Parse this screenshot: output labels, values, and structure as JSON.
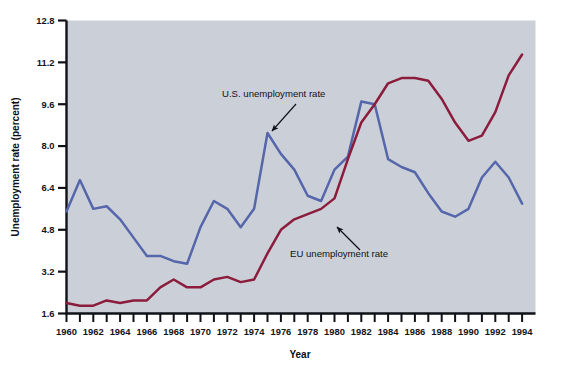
{
  "figure": {
    "background_color": "#ffffff",
    "plot_background_color": "#cbd0d8",
    "axis_color": "#111118"
  },
  "chart_data": {
    "type": "line",
    "title": "",
    "xlabel": "Year",
    "ylabel": "Unemployment rate (percent)",
    "xlim": [
      1960,
      1995
    ],
    "ylim": [
      1.6,
      12.8
    ],
    "yticks": [
      "1.6",
      "3.2",
      "4.8",
      "6.4",
      "8.0",
      "9.6",
      "11.2",
      "12.8"
    ],
    "ytick_values": [
      1.6,
      3.2,
      4.8,
      6.4,
      8.0,
      9.6,
      11.2,
      12.8
    ],
    "xticks": [
      "1960",
      "1962",
      "1964",
      "1966",
      "1968",
      "1970",
      "1972",
      "1974",
      "1976",
      "1978",
      "1980",
      "1982",
      "1984",
      "1986",
      "1988",
      "1990",
      "1992",
      "1994"
    ],
    "xtick_values": [
      1960,
      1962,
      1964,
      1966,
      1968,
      1970,
      1972,
      1974,
      1976,
      1978,
      1980,
      1982,
      1984,
      1986,
      1988,
      1990,
      1992,
      1994
    ],
    "minor_xticks_every": 1,
    "grid": false,
    "legend": "none (inline annotations with arrows)",
    "x": [
      1960,
      1961,
      1962,
      1963,
      1964,
      1965,
      1966,
      1967,
      1968,
      1969,
      1970,
      1971,
      1972,
      1973,
      1974,
      1975,
      1976,
      1977,
      1978,
      1979,
      1980,
      1981,
      1982,
      1983,
      1984,
      1985,
      1986,
      1987,
      1988,
      1989,
      1990,
      1991,
      1992,
      1993,
      1994
    ],
    "series": [
      {
        "name": "U.S. unemployment rate",
        "color": "#5566aa",
        "values": [
          5.5,
          6.7,
          5.6,
          5.7,
          5.2,
          4.5,
          3.8,
          3.8,
          3.6,
          3.5,
          4.9,
          5.9,
          5.6,
          4.9,
          5.6,
          8.5,
          7.7,
          7.1,
          6.1,
          5.9,
          7.1,
          7.6,
          9.7,
          9.6,
          7.5,
          7.2,
          7.0,
          6.2,
          5.5,
          5.3,
          5.6,
          6.8,
          7.4,
          6.8,
          5.8
        ]
      },
      {
        "name": "EU unemployment rate",
        "color": "#8c1c3c",
        "values": [
          2.0,
          1.9,
          1.9,
          2.1,
          2.0,
          2.1,
          2.1,
          2.6,
          2.9,
          2.6,
          2.6,
          2.9,
          3.0,
          2.8,
          2.9,
          3.9,
          4.8,
          5.2,
          5.4,
          5.6,
          6.0,
          7.5,
          8.9,
          9.6,
          10.4,
          10.6,
          10.6,
          10.5,
          9.8,
          8.9,
          8.2,
          8.4,
          9.3,
          10.7,
          11.5
        ]
      }
    ],
    "annotations": [
      {
        "text": "U.S. unemployment rate",
        "label_x": 222,
        "label_y": 97,
        "arrow_from_x": 296,
        "arrow_from_y": 104,
        "arrow_to_x": 272,
        "arrow_to_y": 131,
        "target_series": "U.S. unemployment rate"
      },
      {
        "text": "EU unemployment rate",
        "label_x": 290,
        "label_y": 257,
        "arrow_from_x": 360,
        "arrow_from_y": 250,
        "arrow_to_x": 337,
        "arrow_to_y": 227,
        "target_series": "EU unemployment rate"
      }
    ]
  }
}
